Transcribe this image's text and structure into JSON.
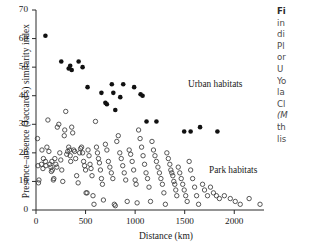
{
  "figure": {
    "ylabel": "Presence–absence (Jaccard's) similarity index",
    "xlabel": "Distance (km)",
    "annotations": {
      "urban": "Urban habitats",
      "park": "Park habitats"
    }
  },
  "caption_fragments": [
    {
      "text": "Fi",
      "style": "b"
    },
    {
      "text": "in",
      "style": ""
    },
    {
      "text": "di",
      "style": ""
    },
    {
      "text": "Pl",
      "style": ""
    },
    {
      "text": "or",
      "style": ""
    },
    {
      "text": "U",
      "style": ""
    },
    {
      "text": "Yo",
      "style": ""
    },
    {
      "text": "la",
      "style": ""
    },
    {
      "text": "Cl",
      "style": ""
    },
    {
      "text": "(M",
      "style": "i"
    },
    {
      "text": "th",
      "style": ""
    },
    {
      "text": "lis",
      "style": ""
    }
  ],
  "colors": {
    "axis": "#2b2b2b",
    "filled_marker": "#111111",
    "open_marker_stroke": "#3a3a3a",
    "text": "#1a1a1a"
  },
  "chart_data": {
    "type": "scatter",
    "title": "",
    "xlabel": "Distance (km)",
    "ylabel": "Presence–absence (Jaccard's) similarity index",
    "xlim": [
      0,
      2300
    ],
    "ylim": [
      0,
      70
    ],
    "xticks": [
      0,
      500,
      1000,
      1500,
      2000
    ],
    "yticks": [
      0,
      10,
      20,
      30,
      40,
      50,
      60,
      70
    ],
    "grid": false,
    "legend": "in-plot text annotations",
    "series": [
      {
        "name": "Urban habitats",
        "marker": "filled-circle",
        "points": [
          [
            95,
            61
          ],
          [
            255,
            52
          ],
          [
            330,
            49.5
          ],
          [
            345,
            50.5
          ],
          [
            360,
            49
          ],
          [
            430,
            52
          ],
          [
            470,
            50
          ],
          [
            520,
            43
          ],
          [
            660,
            41
          ],
          [
            700,
            37.5
          ],
          [
            715,
            37
          ],
          [
            765,
            44
          ],
          [
            780,
            41
          ],
          [
            800,
            35
          ],
          [
            850,
            39.5
          ],
          [
            880,
            44
          ],
          [
            990,
            43
          ],
          [
            1055,
            40.5
          ],
          [
            1075,
            40
          ],
          [
            1115,
            31
          ],
          [
            1215,
            31
          ],
          [
            1495,
            27.5
          ],
          [
            1560,
            27.5
          ],
          [
            1655,
            29
          ],
          [
            1830,
            27.5
          ]
        ]
      },
      {
        "name": "Park habitats",
        "marker": "open-circle",
        "points": [
          [
            15,
            25
          ],
          [
            20,
            15.5
          ],
          [
            25,
            9.5
          ],
          [
            30,
            10.5
          ],
          [
            55,
            16
          ],
          [
            60,
            21
          ],
          [
            70,
            14.5
          ],
          [
            75,
            18
          ],
          [
            95,
            17
          ],
          [
            100,
            15.5
          ],
          [
            110,
            22
          ],
          [
            120,
            31.5
          ],
          [
            130,
            20.5
          ],
          [
            140,
            16
          ],
          [
            150,
            15
          ],
          [
            155,
            13.5
          ],
          [
            160,
            17
          ],
          [
            165,
            14
          ],
          [
            175,
            10.5
          ],
          [
            180,
            11
          ],
          [
            190,
            18
          ],
          [
            200,
            16
          ],
          [
            210,
            15
          ],
          [
            215,
            29
          ],
          [
            230,
            30
          ],
          [
            240,
            20
          ],
          [
            250,
            17.5
          ],
          [
            260,
            14
          ],
          [
            270,
            10
          ],
          [
            285,
            26
          ],
          [
            290,
            28
          ],
          [
            300,
            34.5
          ],
          [
            310,
            19.5
          ],
          [
            320,
            20.5
          ],
          [
            330,
            22
          ],
          [
            340,
            21
          ],
          [
            345,
            19
          ],
          [
            350,
            17
          ],
          [
            360,
            29
          ],
          [
            370,
            27
          ],
          [
            380,
            21
          ],
          [
            390,
            20.5
          ],
          [
            400,
            18
          ],
          [
            410,
            12
          ],
          [
            425,
            9.5
          ],
          [
            440,
            20
          ],
          [
            450,
            21.5
          ],
          [
            460,
            22
          ],
          [
            470,
            20
          ],
          [
            480,
            17
          ],
          [
            490,
            15.5
          ],
          [
            500,
            14
          ],
          [
            505,
            6
          ],
          [
            515,
            6
          ],
          [
            525,
            21
          ],
          [
            535,
            19
          ],
          [
            545,
            16
          ],
          [
            555,
            14.5
          ],
          [
            565,
            12
          ],
          [
            575,
            5
          ],
          [
            585,
            2
          ],
          [
            600,
            31
          ],
          [
            610,
            22
          ],
          [
            620,
            20
          ],
          [
            630,
            18
          ],
          [
            640,
            16.5
          ],
          [
            650,
            14
          ],
          [
            660,
            11
          ],
          [
            670,
            9
          ],
          [
            680,
            3.5
          ],
          [
            700,
            23
          ],
          [
            715,
            21
          ],
          [
            730,
            17
          ],
          [
            745,
            15
          ],
          [
            760,
            13
          ],
          [
            775,
            11
          ],
          [
            790,
            2
          ],
          [
            800,
            1.5
          ],
          [
            815,
            24
          ],
          [
            830,
            26
          ],
          [
            845,
            20
          ],
          [
            860,
            18
          ],
          [
            875,
            15.5
          ],
          [
            890,
            13
          ],
          [
            905,
            10.5
          ],
          [
            920,
            3
          ],
          [
            940,
            21
          ],
          [
            955,
            19.5
          ],
          [
            970,
            17
          ],
          [
            985,
            14
          ],
          [
            1000,
            10.5
          ],
          [
            1010,
            9
          ],
          [
            1020,
            2.5
          ],
          [
            1035,
            28
          ],
          [
            1050,
            25
          ],
          [
            1065,
            22
          ],
          [
            1080,
            19
          ],
          [
            1095,
            16
          ],
          [
            1110,
            13
          ],
          [
            1125,
            11
          ],
          [
            1140,
            8
          ],
          [
            1155,
            3
          ],
          [
            1170,
            24
          ],
          [
            1185,
            21
          ],
          [
            1200,
            19
          ],
          [
            1215,
            17
          ],
          [
            1230,
            15
          ],
          [
            1245,
            13
          ],
          [
            1260,
            11
          ],
          [
            1275,
            9
          ],
          [
            1290,
            6
          ],
          [
            1305,
            2
          ],
          [
            1320,
            20
          ],
          [
            1335,
            18
          ],
          [
            1350,
            16
          ],
          [
            1360,
            14
          ],
          [
            1370,
            13
          ],
          [
            1380,
            12
          ],
          [
            1390,
            10
          ],
          [
            1400,
            9
          ],
          [
            1410,
            7
          ],
          [
            1420,
            5
          ],
          [
            1435,
            15
          ],
          [
            1450,
            13
          ],
          [
            1465,
            11
          ],
          [
            1480,
            9
          ],
          [
            1495,
            7
          ],
          [
            1510,
            5
          ],
          [
            1525,
            3
          ],
          [
            1545,
            17
          ],
          [
            1560,
            14
          ],
          [
            1580,
            11
          ],
          [
            1600,
            8
          ],
          [
            1620,
            5
          ],
          [
            1640,
            2
          ],
          [
            1680,
            9
          ],
          [
            1700,
            7
          ],
          [
            1730,
            5
          ],
          [
            1760,
            8
          ],
          [
            1790,
            6
          ],
          [
            1820,
            5
          ],
          [
            1850,
            4
          ],
          [
            1900,
            5
          ],
          [
            1960,
            4
          ],
          [
            2010,
            3
          ],
          [
            2060,
            2
          ],
          [
            2150,
            4
          ],
          [
            2260,
            2
          ]
        ]
      }
    ]
  }
}
